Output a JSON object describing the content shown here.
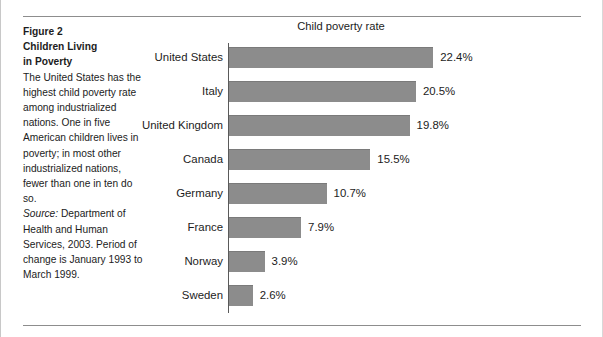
{
  "caption": {
    "heading_line1": "Figure 2",
    "heading_line2": "Children Living",
    "heading_line3": "in Poverty",
    "body": "The United States has the highest child poverty rate among industrialized nations. One in five American children lives in poverty; in most other industrialized nations, fewer than one in ten do so.",
    "source_label": "Source:",
    "source_text": " Department of Health and Human Services, 2003. Period of change is January 1993 to March 1999."
  },
  "chart_data": {
    "type": "bar",
    "orientation": "horizontal",
    "title": "Child poverty rate",
    "xlabel": "",
    "ylabel": "",
    "unit": "%",
    "xlim": [
      0,
      24
    ],
    "grid": false,
    "legend": "none",
    "bar_color": "#8c8c8c",
    "axis_color": "#5a5a5a",
    "categories": [
      "United States",
      "Italy",
      "United Kingdom",
      "Canada",
      "Germany",
      "France",
      "Norway",
      "Sweden"
    ],
    "values": [
      22.4,
      20.5,
      19.8,
      15.5,
      10.7,
      7.9,
      3.9,
      2.6
    ],
    "value_labels": [
      "22.4%",
      "20.5%",
      "19.8%",
      "15.5%",
      "10.7%",
      "7.9%",
      "3.9%",
      "2.6%"
    ]
  }
}
